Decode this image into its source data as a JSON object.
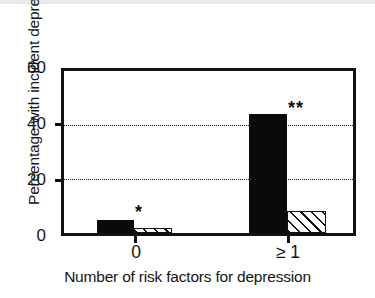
{
  "chart_data": {
    "type": "bar",
    "title": "",
    "subtitle": "",
    "xlabel": "Number of risk factors for depression",
    "ylabel": "Percentage with incident depression",
    "categories": [
      "0",
      "≥ 1"
    ],
    "series": [
      {
        "name": "solid",
        "style": "solid-black",
        "values": [
          5,
          44
        ]
      },
      {
        "name": "hatched",
        "style": "diagonal-hatch",
        "values": [
          2,
          8
        ]
      }
    ],
    "ylim": [
      0,
      60
    ],
    "yticks": [
      0,
      20,
      40,
      60
    ],
    "ytick_labels": [
      "0",
      "20",
      "40",
      "60"
    ],
    "gridlines": [
      20,
      40
    ],
    "grid": "horizontal-dotted",
    "legend": "none",
    "annotations": [
      {
        "text": "*",
        "category": "0",
        "near_value": 7
      },
      {
        "text": "**",
        "category": "≥ 1",
        "near_value": 47
      }
    ]
  },
  "axis": {
    "y_title": "Percentage with incident depression",
    "x_title": "Number of risk factors for depression",
    "y_tick_0": "0",
    "y_tick_20": "20",
    "y_tick_40": "40",
    "y_tick_60": "60",
    "x_cat_0": "0",
    "x_cat_1": "≥ 1"
  },
  "markers": {
    "single_star": "*",
    "double_star": "**"
  },
  "colors": {
    "bar_solid": "#0a0a0a",
    "bar_hatch_line": "#111111",
    "bar_hatch_fill": "#ffffff",
    "axis": "#111111",
    "grid": "#111111",
    "background": "#ffffff",
    "text": "#141414"
  }
}
